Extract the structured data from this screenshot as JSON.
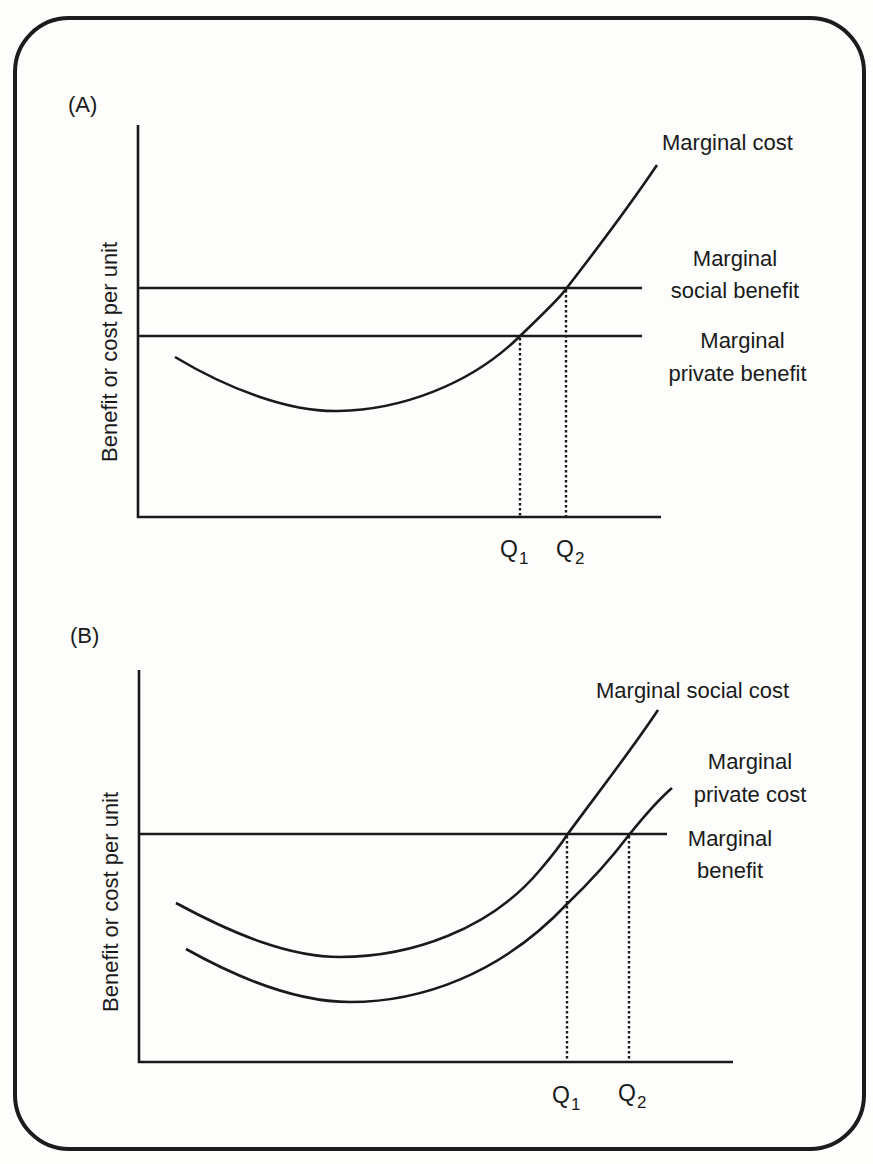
{
  "panels": [
    {
      "id": "A",
      "tag": "(A)",
      "y_axis_label": "Benefit or cost per unit",
      "curve_labels": {
        "marginal_cost": "Marginal cost",
        "msb_line1": "Marginal",
        "msb_line2": "social benefit",
        "mpb_line1": "Marginal",
        "mpb_line2": "private benefit"
      },
      "q1": {
        "letter": "Q",
        "sub": "1"
      },
      "q2": {
        "letter": "Q",
        "sub": "2"
      }
    },
    {
      "id": "B",
      "tag": "(B)",
      "y_axis_label": "Benefit or cost per unit",
      "curve_labels": {
        "marginal_social_cost": "Marginal social cost",
        "mpc_line1": "Marginal",
        "mpc_line2": "private cost",
        "mb_line1": "Marginal",
        "mb_line2": "benefit"
      },
      "q1": {
        "letter": "Q",
        "sub": "1"
      },
      "q2": {
        "letter": "Q",
        "sub": "2"
      }
    }
  ],
  "colors": {
    "ink": "#1a1a1a",
    "background": "#fdfdfc"
  }
}
